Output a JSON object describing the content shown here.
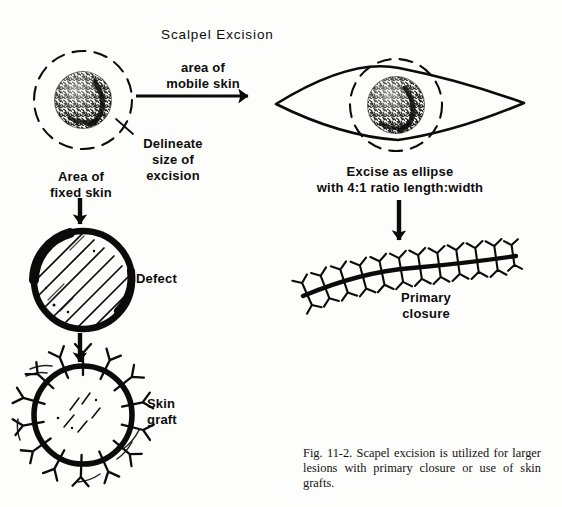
{
  "figure": {
    "title": "Scalpel Excision",
    "background_color": "#fdfdfb",
    "ink_color": "#0b0b0b",
    "caption": "Fig. 11-2. Scapel excision is utilized for larger lesions with primary closure or use of skin grafts.",
    "caption_number": "Fig. 11-2."
  },
  "labels": {
    "area_of_mobile_skin": "area of\nmobile skin",
    "delineate_size_of_excision": "Delineate\nsize of\nexcision",
    "area_of_fixed_skin": "Area of\nfixed skin",
    "excise_as_ellipse": "Excise as ellipse\nwith 4:1 ratio length:width",
    "defect": "Defect",
    "skin_graft": "Skin\ngraft",
    "primary_closure": "Primary\nclosure"
  },
  "panels": [
    {
      "id": "lesion-outline",
      "name": "Delineated lesion in mobile skin",
      "shape": "dashed-circle-with-stippled-lesion",
      "center": [
        83,
        100
      ],
      "dashed_circle_radius": 49,
      "lesion_radius": 28
    },
    {
      "id": "ellipse-excision",
      "name": "Elliptical excision around lesion",
      "shape": "lens-ellipse-with-dashed-circle-and-lesion",
      "center": [
        400,
        103
      ],
      "ellipse_half_length": 124,
      "ellipse_half_width": 36,
      "dashed_circle_radius": 46,
      "lesion_radius": 28,
      "ratio": "4:1"
    },
    {
      "id": "defect",
      "name": "Open circular defect with hatching",
      "shape": "hatched-circle",
      "center": [
        83,
        280
      ],
      "radius": 50
    },
    {
      "id": "skin-graft",
      "name": "Circular skin graft sutured in place",
      "shape": "circle-with-sutures",
      "center": [
        83,
        415
      ],
      "radius": 50,
      "suture_count": 14
    },
    {
      "id": "primary-closure",
      "name": "Sutured linear primary closure",
      "shape": "curved-suture-line",
      "start": [
        303,
        295
      ],
      "end": [
        512,
        262
      ],
      "suture_count": 12
    }
  ],
  "arrows": [
    {
      "id": "arrow-to-ellipse",
      "direction": "right",
      "from": [
        138,
        96
      ],
      "to": [
        253,
        96
      ]
    },
    {
      "id": "arrow-fixed-skin-to-defect",
      "direction": "down",
      "from": [
        80,
        200
      ],
      "to": [
        80,
        228
      ]
    },
    {
      "id": "arrow-defect-to-graft",
      "direction": "down",
      "from": [
        80,
        334
      ],
      "to": [
        80,
        366
      ]
    },
    {
      "id": "arrow-ellipse-to-closure",
      "direction": "down",
      "from": [
        399,
        203
      ],
      "to": [
        399,
        245
      ]
    }
  ],
  "leaders": [
    {
      "id": "leader-delineate",
      "from": [
        130,
        133
      ],
      "to": [
        117,
        122
      ]
    }
  ]
}
